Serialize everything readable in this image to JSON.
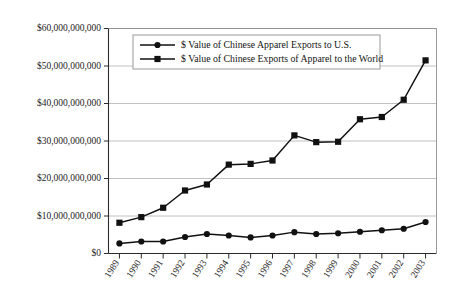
{
  "chart_data": {
    "type": "line",
    "title": "",
    "xlabel": "",
    "ylabel": "",
    "grid": true,
    "legend_position": "top-center-inside",
    "categories": [
      "1989",
      "1990",
      "1991",
      "1992",
      "1993",
      "1994",
      "1995",
      "1996",
      "1997",
      "1998",
      "1999",
      "2000",
      "2001",
      "2002",
      "2003"
    ],
    "ylim": [
      0,
      60000000000
    ],
    "ytick_values": [
      0,
      10000000000,
      20000000000,
      30000000000,
      40000000000,
      50000000000,
      60000000000
    ],
    "ytick_labels": [
      "$0",
      "$10,000,000,000",
      "$20,000,000,000",
      "$30,000,000,000",
      "$40,000,000,000",
      "$50,000,000,000",
      "$60,000,000,000"
    ],
    "series": [
      {
        "name": "$ Value of Chinese Apparel Exports to U.S.",
        "marker": "circle",
        "color": "#111111",
        "values": [
          2700000000,
          3200000000,
          3200000000,
          4400000000,
          5200000000,
          4800000000,
          4300000000,
          4800000000,
          5700000000,
          5200000000,
          5400000000,
          5800000000,
          6200000000,
          6600000000,
          8400000000
        ]
      },
      {
        "name": "$ Value of Chinese Exports of Apparel to the World",
        "marker": "square",
        "color": "#111111",
        "values": [
          8200000000,
          9700000000,
          12200000000,
          16800000000,
          18400000000,
          23700000000,
          23900000000,
          24800000000,
          31500000000,
          29700000000,
          29800000000,
          35800000000,
          36400000000,
          41000000000,
          51500000000
        ]
      }
    ]
  },
  "legend": {
    "items": [
      {
        "label": "$ Value of Chinese Apparel Exports to U.S.",
        "marker": "circle"
      },
      {
        "label": "$ Value of Chinese Exports of Apparel to the World",
        "marker": "square"
      }
    ]
  }
}
